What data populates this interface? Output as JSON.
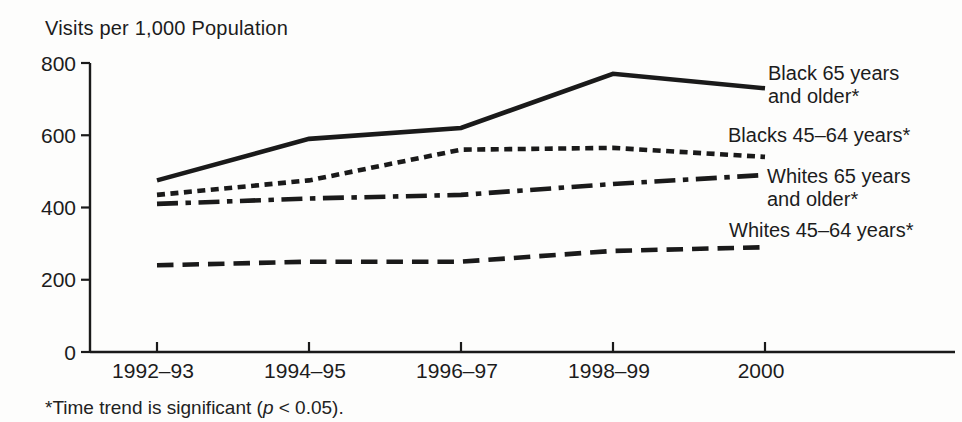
{
  "page": {
    "background_color": "#fdfdfc",
    "ink_color": "#1a1a1a"
  },
  "chart": {
    "title": "Visits per 1,000 Population",
    "footnote_prefix": "*Time trend is significant (",
    "footnote_italic": "p",
    "footnote_suffix": " < 0.05)."
  },
  "chart_data": {
    "type": "line",
    "title": "Visits per 1,000 Population",
    "xlabel": "",
    "ylabel": "Visits per 1,000 Population",
    "ylim": [
      0,
      800
    ],
    "yticks": [
      0,
      200,
      400,
      600,
      800
    ],
    "grid": false,
    "legend_position": "right-of-lines",
    "categories": [
      "1992–93",
      "1994–95",
      "1996–97",
      "1998–99",
      "2000"
    ],
    "series": [
      {
        "name": "Black 65 years and older*",
        "label": "Black 65 years\nand older*",
        "line_style": "solid",
        "values": [
          475,
          590,
          620,
          770,
          730
        ]
      },
      {
        "name": "Blacks 45–64 years*",
        "label": "Blacks 45–64 years*",
        "line_style": "dotted",
        "values": [
          435,
          475,
          560,
          565,
          540
        ]
      },
      {
        "name": "Whites 65 years and older*",
        "label": "Whites 65 years\nand older*",
        "line_style": "dash-dot",
        "values": [
          410,
          425,
          435,
          465,
          490
        ]
      },
      {
        "name": "Whites 45–64 years*",
        "label": "Whites 45–64 years*",
        "line_style": "dashed",
        "values": [
          240,
          250,
          250,
          280,
          290
        ]
      }
    ],
    "footnote": "*Time trend is significant (p < 0.05)."
  }
}
